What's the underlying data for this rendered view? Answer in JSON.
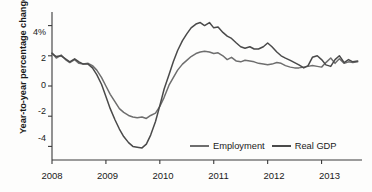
{
  "chart_data": {
    "type": "line",
    "title": "",
    "xlabel": "",
    "ylabel": "Year-to-year percentage change",
    "xlim": [
      2008.0,
      2013.75
    ],
    "ylim": [
      -4.9,
      4.9
    ],
    "grid": false,
    "legend_position": "bottom-right",
    "x_tick_labels": [
      "2008",
      "2009",
      "2010",
      "2011",
      "2012",
      "2013"
    ],
    "x_tick_values": [
      2008,
      2009,
      2010,
      2011,
      2012,
      2013
    ],
    "y_tick_labels": [
      "4%",
      "2",
      "0",
      "-2",
      "-4"
    ],
    "y_tick_values": [
      4,
      2,
      0,
      -2,
      -4
    ],
    "series": [
      {
        "name": "Employment",
        "color": "#6e6e6e",
        "x": [
          2008.0,
          2008.08,
          2008.17,
          2008.25,
          2008.33,
          2008.42,
          2008.5,
          2008.58,
          2008.67,
          2008.75,
          2008.83,
          2008.92,
          2009.0,
          2009.08,
          2009.17,
          2009.25,
          2009.33,
          2009.42,
          2009.5,
          2009.58,
          2009.67,
          2009.75,
          2009.83,
          2009.92,
          2010.0,
          2010.08,
          2010.17,
          2010.25,
          2010.33,
          2010.42,
          2010.5,
          2010.58,
          2010.67,
          2010.75,
          2010.83,
          2010.92,
          2011.0,
          2011.08,
          2011.17,
          2011.25,
          2011.33,
          2011.42,
          2011.5,
          2011.58,
          2011.67,
          2011.75,
          2011.83,
          2011.92,
          2012.0,
          2012.08,
          2012.17,
          2012.25,
          2012.33,
          2012.42,
          2012.5,
          2012.58,
          2012.67,
          2012.75,
          2012.83,
          2012.92,
          2013.0,
          2013.08,
          2013.17,
          2013.25,
          2013.33,
          2013.42,
          2013.5,
          2013.58,
          2013.67
        ],
        "values": [
          2.2,
          1.85,
          2.05,
          1.75,
          1.55,
          1.75,
          1.5,
          1.45,
          1.5,
          1.35,
          1.05,
          0.55,
          0.0,
          -0.55,
          -1.05,
          -1.5,
          -1.75,
          -1.95,
          -2.05,
          -2.1,
          -2.05,
          -2.15,
          -1.95,
          -1.8,
          -1.35,
          -0.75,
          0.05,
          0.55,
          1.05,
          1.45,
          1.7,
          1.95,
          2.15,
          2.25,
          2.3,
          2.25,
          2.15,
          2.2,
          2.0,
          1.75,
          1.9,
          1.65,
          1.6,
          1.7,
          1.65,
          1.6,
          1.5,
          1.45,
          1.4,
          1.45,
          1.55,
          1.5,
          1.35,
          1.25,
          1.2,
          1.2,
          1.25,
          1.3,
          1.35,
          1.3,
          1.25,
          1.55,
          1.85,
          1.5,
          1.8,
          1.5,
          1.6,
          1.55,
          1.6
        ]
      },
      {
        "name": "Real GDP",
        "color": "#4a4a4a",
        "x": [
          2008.0,
          2008.08,
          2008.17,
          2008.25,
          2008.33,
          2008.42,
          2008.5,
          2008.58,
          2008.67,
          2008.75,
          2008.83,
          2008.92,
          2009.0,
          2009.08,
          2009.17,
          2009.25,
          2009.33,
          2009.42,
          2009.5,
          2009.58,
          2009.67,
          2009.75,
          2009.83,
          2009.92,
          2010.0,
          2010.08,
          2010.17,
          2010.25,
          2010.33,
          2010.42,
          2010.5,
          2010.58,
          2010.67,
          2010.75,
          2010.83,
          2010.92,
          2011.0,
          2011.08,
          2011.17,
          2011.25,
          2011.33,
          2011.42,
          2011.5,
          2011.58,
          2011.67,
          2011.75,
          2011.83,
          2011.92,
          2012.0,
          2012.08,
          2012.17,
          2012.25,
          2012.33,
          2012.42,
          2012.5,
          2012.58,
          2012.67,
          2012.75,
          2012.83,
          2012.92,
          2013.0,
          2013.08,
          2013.17,
          2013.25,
          2013.33,
          2013.42,
          2013.5,
          2013.58,
          2013.67
        ],
        "values": [
          2.15,
          1.95,
          2.0,
          1.8,
          1.6,
          1.8,
          1.6,
          1.45,
          1.45,
          1.2,
          0.75,
          0.1,
          -0.7,
          -1.5,
          -2.25,
          -2.85,
          -3.35,
          -3.75,
          -4.0,
          -4.05,
          -4.1,
          -3.85,
          -3.25,
          -2.35,
          -1.3,
          -0.2,
          0.75,
          1.6,
          2.35,
          3.0,
          3.45,
          3.85,
          4.1,
          4.2,
          4.0,
          4.2,
          3.85,
          3.9,
          3.55,
          3.3,
          3.15,
          2.85,
          2.6,
          2.5,
          2.6,
          2.45,
          2.45,
          2.6,
          2.85,
          2.6,
          2.25,
          2.0,
          1.85,
          1.7,
          1.55,
          1.4,
          1.2,
          1.35,
          1.9,
          2.0,
          1.75,
          1.4,
          1.3,
          1.75,
          2.0,
          1.55,
          1.75,
          1.6,
          1.65
        ]
      }
    ]
  },
  "legend": {
    "items": [
      {
        "label": "Employment"
      },
      {
        "label": "Real GDP"
      }
    ]
  }
}
